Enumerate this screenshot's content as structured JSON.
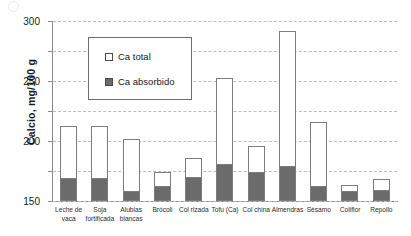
{
  "chart_data": {
    "type": "bar",
    "subtype": "stacked-overlay",
    "title": "",
    "xlabel": "",
    "ylabel": "Calcio, mg/100 g",
    "ylim": [
      0,
      300
    ],
    "yticks": [
      0,
      50,
      100,
      150,
      200,
      250,
      300
    ],
    "grid": true,
    "legend_position": "upper-left-inside",
    "categories": [
      "Leche de vaca",
      "Soja fortificada",
      "Alubias blancas",
      "Brócoli",
      "Col rizada",
      "Tofu (Ca)",
      "Col china",
      "Almendras",
      "Sésamo",
      "Coliflor",
      "Repollo"
    ],
    "series": [
      {
        "name": "Ca total",
        "color": "#ffffff",
        "values": [
          125,
          125,
          103,
          48,
          71,
          205,
          92,
          283,
          131,
          26,
          37
        ]
      },
      {
        "name": "Ca absorbido",
        "color": "#6b6b6b",
        "values": [
          38,
          38,
          16,
          25,
          40,
          62,
          48,
          58,
          25,
          16,
          19
        ]
      }
    ]
  },
  "axis": {
    "y_label": "Calcio, mg/100 g",
    "y_ticks": [
      "300",
      "250",
      "200",
      "150",
      "100",
      "50",
      "0"
    ]
  },
  "legend": {
    "items": [
      {
        "label": "Ca total",
        "swatch": "white-square"
      },
      {
        "label": "Ca absorbido",
        "swatch": "dark-gray-square"
      }
    ]
  },
  "x_labels": [
    {
      "line1": "Leche de",
      "line2": "vaca"
    },
    {
      "line1": "Soja",
      "line2": "fortificada"
    },
    {
      "line1": "Alubias",
      "line2": "blancas"
    },
    {
      "line1": "Brócoli",
      "line2": ""
    },
    {
      "line1": "Col rizada",
      "line2": ""
    },
    {
      "line1": "Tofu (Ca)",
      "line2": ""
    },
    {
      "line1": "Col china",
      "line2": ""
    },
    {
      "line1": "Almendras",
      "line2": ""
    },
    {
      "line1": "Sésamo",
      "line2": ""
    },
    {
      "line1": "Coliflor",
      "line2": ""
    },
    {
      "line1": "Repollo",
      "line2": ""
    }
  ],
  "colors": {
    "total": "#ffffff",
    "absorbed": "#6b6b6b",
    "outline": "#7d7d7d",
    "grid": "#bdbdbd",
    "axis": "#8a8a8a"
  }
}
